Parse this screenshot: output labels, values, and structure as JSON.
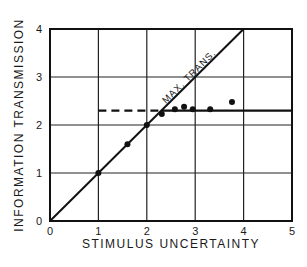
{
  "chart_data": {
    "type": "scatter",
    "title": "",
    "xlabel": "STIMULUS UNCERTAINTY",
    "ylabel": "INFORMATION TRANSMISSION",
    "xlim": [
      0,
      5
    ],
    "ylim": [
      0,
      4
    ],
    "xticks": [
      "0",
      "1",
      "2",
      "3",
      "4",
      "5"
    ],
    "yticks": [
      "0",
      "1",
      "2",
      "3",
      "4"
    ],
    "grid": true,
    "legend": null,
    "annotations": [
      "MAX. TRANS."
    ],
    "series": [
      {
        "name": "observed",
        "type": "scatter",
        "x": [
          1.0,
          1.6,
          2.0,
          2.31,
          2.58,
          2.77,
          2.95,
          3.31,
          3.76
        ],
        "y": [
          1.0,
          1.6,
          2.0,
          2.23,
          2.33,
          2.38,
          2.33,
          2.33,
          2.48
        ]
      },
      {
        "name": "MAX. TRANS.",
        "type": "line",
        "x": [
          0,
          4
        ],
        "y": [
          0,
          4
        ]
      },
      {
        "name": "asymptote (dashed)",
        "type": "line",
        "style": "dashed",
        "x": [
          1.0,
          2.3
        ],
        "y": [
          2.3,
          2.3
        ]
      },
      {
        "name": "asymptote (solid)",
        "type": "line",
        "style": "solid",
        "x": [
          2.3,
          5.0
        ],
        "y": [
          2.3,
          2.3
        ]
      }
    ]
  }
}
